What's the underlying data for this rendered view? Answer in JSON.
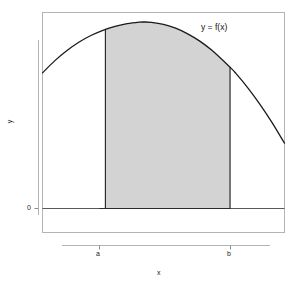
{
  "chart_data": {
    "type": "area",
    "title": "",
    "xlabel": "x",
    "ylabel": "y",
    "annotation": "y = f(x)",
    "grid": false,
    "legend": "none",
    "x_tick_labels": [
      "a",
      "b"
    ],
    "y_tick_labels": [
      "0"
    ],
    "x_tick_values": [
      0.26,
      0.775
    ],
    "y_tick_values": [
      0
    ],
    "xlim": [
      0,
      1
    ],
    "ylim": [
      -0.18,
      1.05
    ],
    "shaded_region": {
      "from_label": "a",
      "to_label": "b",
      "from_x": 0.26,
      "to_x": 0.775,
      "fill_color": "#d3d3d3",
      "baseline_y": 0
    },
    "curve": {
      "name": "f(x)",
      "color": "#1a1a1a",
      "description": "downward-opening parabola",
      "x": [
        0.0,
        0.05,
        0.1,
        0.15,
        0.2,
        0.26,
        0.3,
        0.35,
        0.4,
        0.42,
        0.45,
        0.5,
        0.55,
        0.6,
        0.65,
        0.7,
        0.775,
        0.8,
        0.85,
        0.9,
        0.95,
        1.0
      ],
      "y": [
        0.722,
        0.786,
        0.84,
        0.885,
        0.921,
        0.954,
        0.97,
        0.984,
        0.992,
        0.993,
        0.991,
        0.98,
        0.96,
        0.93,
        0.891,
        0.842,
        0.752,
        0.718,
        0.64,
        0.552,
        0.455,
        0.348
      ]
    },
    "curve_endpoints": {
      "left": {
        "x": 0.0,
        "y": 0.722
      },
      "right": {
        "x": 1.0,
        "y": 0.348
      },
      "peak": {
        "x": 0.42,
        "y": 0.993
      }
    }
  },
  "frame": {
    "border_color": "#b4b4b4",
    "background": "#ffffff"
  },
  "colors": {
    "fill": "#d3d3d3",
    "curve": "#1a1a1a",
    "baseline": "#4d4d4d",
    "frame": "#b4b4b4",
    "text": "#1a1a1a"
  }
}
